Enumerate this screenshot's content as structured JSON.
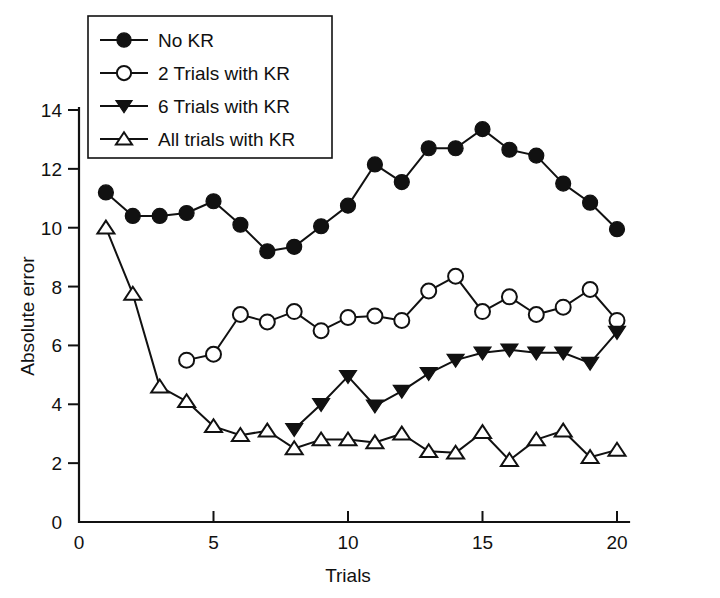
{
  "chart_data": {
    "type": "line",
    "title": "",
    "xlabel": "Trials",
    "ylabel": "Absolute error",
    "xlim": [
      0,
      20
    ],
    "ylim": [
      0,
      14
    ],
    "xticks": [
      0,
      5,
      10,
      15,
      20
    ],
    "yticks": [
      0,
      2,
      4,
      6,
      8,
      10,
      12,
      14
    ],
    "xtick_labels": [
      "0",
      "5",
      "10",
      "15",
      "20"
    ],
    "ytick_labels": [
      "0",
      "2",
      "4",
      "6",
      "8",
      "10",
      "12",
      "14"
    ],
    "grid": false,
    "legend_position": "upper-left-inside",
    "x": [
      1,
      2,
      3,
      4,
      5,
      6,
      7,
      8,
      9,
      10,
      11,
      12,
      13,
      14,
      15,
      16,
      17,
      18,
      19,
      20
    ],
    "series": [
      {
        "name": "No KR",
        "marker": "filled-circle",
        "x": [
          1,
          2,
          3,
          4,
          5,
          6,
          7,
          8,
          9,
          10,
          11,
          12,
          13,
          14,
          15,
          16,
          17,
          18,
          19,
          20
        ],
        "values": [
          11.2,
          10.4,
          10.4,
          10.5,
          10.9,
          10.1,
          9.2,
          9.35,
          10.05,
          10.75,
          12.15,
          11.55,
          12.7,
          12.7,
          13.35,
          12.65,
          12.45,
          11.5,
          10.85,
          9.95
        ]
      },
      {
        "name": "2 Trials with KR",
        "marker": "open-circle",
        "x": [
          4,
          5,
          6,
          7,
          8,
          9,
          10,
          11,
          12,
          13,
          14,
          15,
          16,
          17,
          18,
          19,
          20
        ],
        "values": [
          5.5,
          5.7,
          7.05,
          6.8,
          7.15,
          6.5,
          6.95,
          7.0,
          6.85,
          7.85,
          8.35,
          7.15,
          7.65,
          7.05,
          7.3,
          7.9,
          6.85
        ]
      },
      {
        "name": "6 Trials with KR",
        "marker": "filled-down-triangle",
        "x": [
          8,
          9,
          10,
          11,
          12,
          13,
          14,
          15,
          16,
          17,
          18,
          19,
          20
        ],
        "values": [
          3.15,
          4.0,
          4.95,
          3.95,
          4.45,
          5.05,
          5.5,
          5.75,
          5.85,
          5.75,
          5.75,
          5.4,
          6.45
        ]
      },
      {
        "name": "All trials with KR",
        "marker": "open-up-triangle",
        "x": [
          1,
          2,
          3,
          4,
          5,
          6,
          7,
          8,
          9,
          10,
          11,
          12,
          13,
          14,
          15,
          16,
          17,
          18,
          19,
          20
        ],
        "values": [
          10.0,
          7.75,
          4.6,
          4.1,
          3.25,
          2.95,
          3.1,
          2.5,
          2.8,
          2.8,
          2.7,
          3.0,
          2.4,
          2.35,
          3.05,
          2.1,
          2.8,
          3.1,
          2.2,
          2.45
        ]
      }
    ]
  },
  "legend": {
    "items": [
      {
        "label": "No KR",
        "marker": "filled-circle"
      },
      {
        "label": "2 Trials with KR",
        "marker": "open-circle"
      },
      {
        "label": "6 Trials with KR",
        "marker": "filled-down-triangle"
      },
      {
        "label": "All trials with KR",
        "marker": "open-up-triangle"
      }
    ]
  },
  "colors": {
    "ink": "#111111",
    "background": "#ffffff"
  }
}
